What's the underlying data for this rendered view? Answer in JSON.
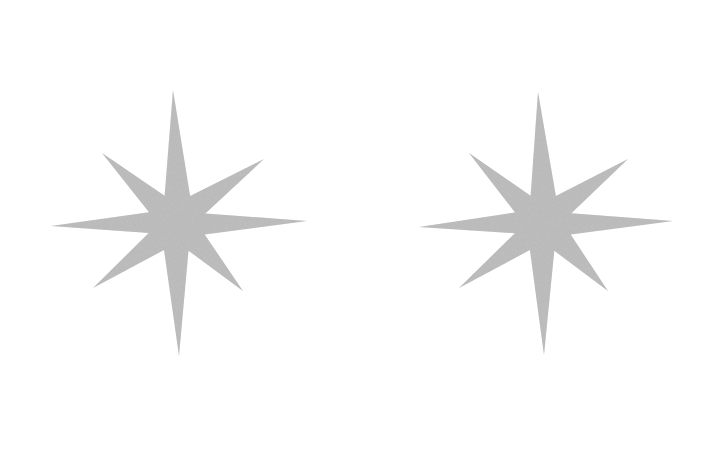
{
  "canvas": {
    "width": 724,
    "height": 454,
    "background": "#ffffff"
  },
  "stars": [
    {
      "name": "left-star",
      "icon": "eight-point-star-icon",
      "fill": "#b9b9b9",
      "center": [
        177,
        223
      ],
      "tips": {
        "top": [
          173,
          90
        ],
        "upper_right": [
          264,
          159
        ],
        "right": [
          307,
          221
        ],
        "lower_right": [
          243,
          291
        ],
        "bottom": [
          179,
          356
        ],
        "lower_left": [
          93,
          288
        ],
        "left": [
          51,
          226
        ],
        "upper_left": [
          102,
          153
        ]
      }
    },
    {
      "name": "right-star",
      "icon": "eight-point-star-icon",
      "fill": "#b9b9b9",
      "center": [
        543,
        223
      ],
      "tips": {
        "top": [
          538,
          92
        ],
        "upper_right": [
          628,
          159
        ],
        "right": [
          673,
          221
        ],
        "lower_right": [
          608,
          291
        ],
        "bottom": [
          544,
          355
        ],
        "lower_left": [
          459,
          288
        ],
        "left": [
          419,
          227
        ],
        "upper_left": [
          469,
          153
        ]
      }
    }
  ]
}
